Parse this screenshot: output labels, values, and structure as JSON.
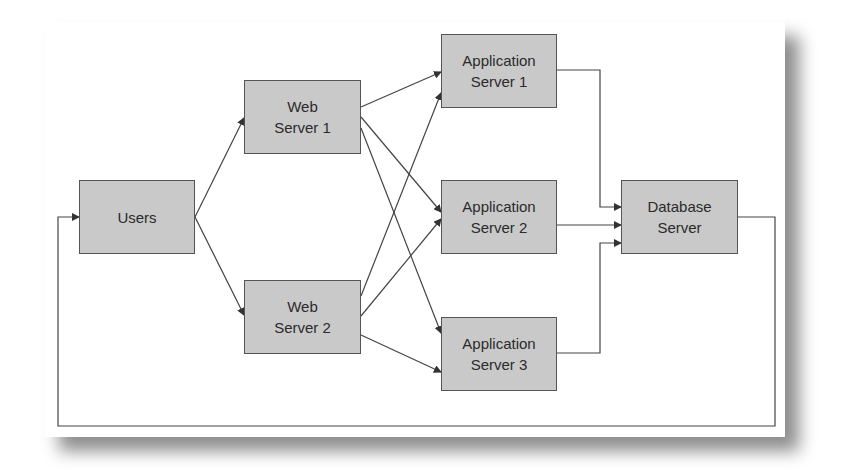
{
  "diagram": {
    "nodes": [
      {
        "id": "users",
        "label": "Users",
        "x": 79,
        "y": 180,
        "w": 116,
        "h": 74
      },
      {
        "id": "web1",
        "label": "Web\nServer 1",
        "x": 244,
        "y": 80,
        "w": 117,
        "h": 74
      },
      {
        "id": "web2",
        "label": "Web\nServer 2",
        "x": 244,
        "y": 280,
        "w": 117,
        "h": 74
      },
      {
        "id": "app1",
        "label": "Application\nServer 1",
        "x": 441,
        "y": 34,
        "w": 116,
        "h": 74
      },
      {
        "id": "app2",
        "label": "Application\nServer 2",
        "x": 441,
        "y": 180,
        "w": 116,
        "h": 74
      },
      {
        "id": "app3",
        "label": "Application\nServer 3",
        "x": 441,
        "y": 317,
        "w": 116,
        "h": 74
      },
      {
        "id": "db",
        "label": "Database\nServer",
        "x": 621,
        "y": 180,
        "w": 117,
        "h": 74
      }
    ],
    "edges": [
      {
        "from": "users",
        "to": "web1"
      },
      {
        "from": "users",
        "to": "web2"
      },
      {
        "from": "web1",
        "to": "app1"
      },
      {
        "from": "web1",
        "to": "app2"
      },
      {
        "from": "web1",
        "to": "app3"
      },
      {
        "from": "web2",
        "to": "app1"
      },
      {
        "from": "web2",
        "to": "app2"
      },
      {
        "from": "web2",
        "to": "app3"
      },
      {
        "from": "app1",
        "to": "db"
      },
      {
        "from": "app2",
        "to": "db"
      },
      {
        "from": "app3",
        "to": "db"
      },
      {
        "from": "db",
        "to": "users",
        "type": "feedback-loop"
      }
    ],
    "colors": {
      "node_fill": "#c9c9c9",
      "node_border": "#555555",
      "line": "#444444"
    }
  }
}
